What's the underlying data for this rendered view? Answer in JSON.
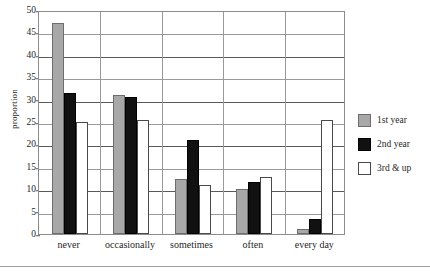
{
  "chart_data": {
    "type": "bar",
    "title": "",
    "xlabel": "",
    "ylabel": "proportion",
    "ylim": [
      0,
      50
    ],
    "ytick_step": 5,
    "yticks": [
      0,
      5,
      10,
      15,
      20,
      25,
      30,
      35,
      40,
      45,
      50
    ],
    "grid": true,
    "legend_position": "right",
    "categories": [
      "never",
      "occasionally",
      "sometimes",
      "often",
      "every day"
    ],
    "series": [
      {
        "name": "1st year",
        "color": "#a8a8a8",
        "values": [
          47,
          31,
          12.3,
          10,
          1.2
        ]
      },
      {
        "name": "2nd year",
        "color": "#111111",
        "values": [
          31.5,
          30.5,
          21,
          11.7,
          3.3
        ]
      },
      {
        "name": "3rd & up",
        "color": "#ffffff",
        "values": [
          25,
          25.4,
          11,
          12.7,
          25.4
        ]
      }
    ]
  },
  "axis": {
    "y_title": "proportion"
  },
  "legend": {
    "items": [
      {
        "label": "1st year"
      },
      {
        "label": "2nd year"
      },
      {
        "label": "3rd & up"
      }
    ]
  }
}
